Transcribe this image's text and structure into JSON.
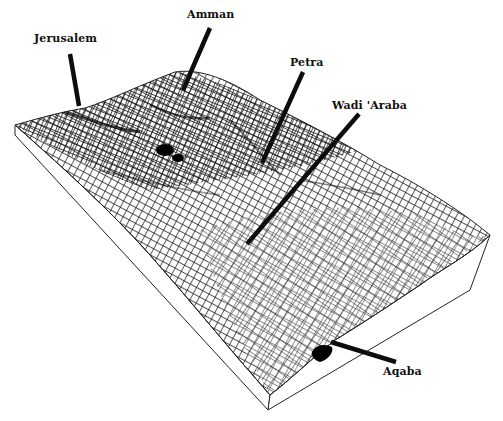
{
  "diagram": {
    "type": "3d-terrain-wireframe-block",
    "colors": {
      "background": "#ffffff",
      "mesh": "#1a1a1a",
      "outline": "#222222",
      "leader": "#0d0d0d",
      "side_face": "#ffffff"
    },
    "labels": [
      {
        "id": "jerusalem",
        "text": "Jerusalem",
        "x": 34,
        "y": 32
      },
      {
        "id": "amman",
        "text": "Amman",
        "x": 187,
        "y": 8
      },
      {
        "id": "petra",
        "text": "Petra",
        "x": 290,
        "y": 56
      },
      {
        "id": "wadi-araba",
        "text": "Wadi 'Araba",
        "x": 332,
        "y": 99
      },
      {
        "id": "aqaba",
        "text": "Aqaba",
        "x": 383,
        "y": 365
      }
    ]
  }
}
